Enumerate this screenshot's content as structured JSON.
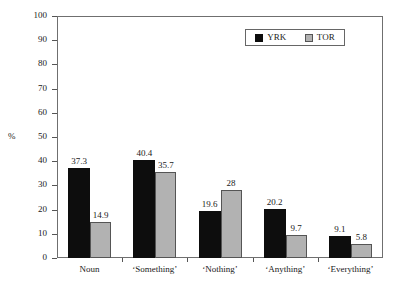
{
  "chart_data": {
    "type": "bar",
    "title": "",
    "xlabel": "",
    "ylabel": "%",
    "ylim": [
      0,
      100
    ],
    "ytick_step": 10,
    "yticks": [
      "100",
      "90",
      "80",
      "70",
      "60",
      "50",
      "40",
      "30",
      "20",
      "10",
      "0"
    ],
    "grid": false,
    "legend_position": "top-right",
    "categories": [
      "Noun",
      "‘Something’",
      "‘Nothing’",
      "‘Anything’",
      "‘Everything’"
    ],
    "series": [
      {
        "name": "YRK",
        "color": "#0d0d0d",
        "values": [
          37.3,
          40.4,
          19.6,
          20.2,
          9.1
        ],
        "labels": [
          "37.3",
          "40.4",
          "19.6",
          "20.2",
          "9.1"
        ]
      },
      {
        "name": "TOR",
        "color": "#b2b2b2",
        "values": [
          14.9,
          35.7,
          28,
          9.7,
          5.8
        ],
        "labels": [
          "14.9",
          "35.7",
          "28",
          "9.7",
          "5.8"
        ]
      }
    ]
  },
  "axis": {
    "y_label": "%",
    "y_ticks": [
      {
        "label": "100",
        "value": 100
      },
      {
        "label": "90",
        "value": 90
      },
      {
        "label": "80",
        "value": 80
      },
      {
        "label": "70",
        "value": 70
      },
      {
        "label": "60",
        "value": 60
      },
      {
        "label": "50",
        "value": 50
      },
      {
        "label": "40",
        "value": 40
      },
      {
        "label": "30",
        "value": 30
      },
      {
        "label": "20",
        "value": 20
      },
      {
        "label": "10",
        "value": 10
      },
      {
        "label": "0",
        "value": 0
      }
    ],
    "x_labels": [
      "Noun",
      "‘Something’",
      "‘Nothing’",
      "‘Anything’",
      "‘Everything’"
    ]
  },
  "legend": {
    "entries": [
      {
        "label": "YRK",
        "color": "#0d0d0d"
      },
      {
        "label": "TOR",
        "color": "#b2b2b2"
      }
    ]
  }
}
